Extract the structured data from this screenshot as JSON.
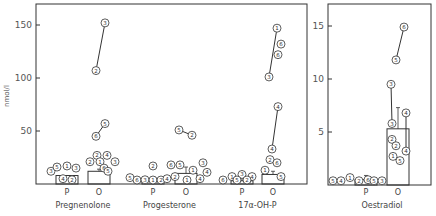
{
  "chart_data": [
    {
      "type": "bar",
      "panel": "left",
      "ylabel": "nmol/l",
      "ylim": [
        0,
        165
      ],
      "yticks": [
        50,
        100,
        150
      ],
      "grid": false,
      "groups": [
        {
          "name": "Pregnenolone",
          "conditions": [
            {
              "label": "P",
              "x": 67,
              "bar": 8,
              "points": [
                {
                  "id": "3",
                  "v": 12,
                  "x": 51
                },
                {
                  "id": "5",
                  "v": 16,
                  "x": 57
                },
                {
                  "id": "1",
                  "v": 17,
                  "x": 67
                },
                {
                  "id": "3",
                  "v": 15,
                  "x": 76
                },
                {
                  "id": "4",
                  "v": 5,
                  "x": 63
                },
                {
                  "id": "2",
                  "v": 4,
                  "x": 72
                }
              ]
            },
            {
              "label": "O",
              "x": 99,
              "bar": 12,
              "err": 14,
              "points": [
                {
                  "id": "2",
                  "v": 27,
                  "x": 97
                },
                {
                  "id": "4",
                  "v": 27,
                  "x": 107
                },
                {
                  "id": "2",
                  "v": 21,
                  "x": 90
                },
                {
                  "id": "1",
                  "v": 21,
                  "x": 100
                },
                {
                  "id": "3",
                  "v": 21,
                  "x": 115
                },
                {
                  "id": "6",
                  "v": 15,
                  "x": 104
                },
                {
                  "id": "5",
                  "v": 12,
                  "x": 108
                },
                {
                  "id": "6",
                  "v": 45,
                  "x": 96,
                  "link": 1
                },
                {
                  "id": "5",
                  "v": 57,
                  "x": 105,
                  "link": 1
                },
                {
                  "id": "2",
                  "v": 107,
                  "x": 96,
                  "link": 2
                },
                {
                  "id": "3",
                  "v": 152,
                  "x": 105,
                  "link": 2
                }
              ]
            }
          ]
        },
        {
          "name": "Progesterone",
          "conditions": [
            {
              "label": "P",
              "x": 153,
              "bar": 4,
              "err": 6,
              "points": [
                {
                  "id": "5",
                  "v": 6,
                  "x": 130
                },
                {
                  "id": "6",
                  "v": 3,
                  "x": 137
                },
                {
                  "id": "3",
                  "v": 4,
                  "x": 145
                },
                {
                  "id": "1",
                  "v": 3,
                  "x": 153
                },
                {
                  "id": "2",
                  "v": 3,
                  "x": 161
                },
                {
                  "id": "4",
                  "v": 5,
                  "x": 167
                },
                {
                  "id": "2",
                  "v": 17,
                  "x": 153
                }
              ]
            },
            {
              "label": "O",
              "x": 186,
              "bar": 10,
              "err": 16,
              "points": [
                {
                  "id": "6",
                  "v": 18,
                  "x": 171
                },
                {
                  "id": "5",
                  "v": 18,
                  "x": 180
                },
                {
                  "id": "3",
                  "v": 20,
                  "x": 203
                },
                {
                  "id": "1",
                  "v": 13,
                  "x": 193
                },
                {
                  "id": "4",
                  "v": 11,
                  "x": 207
                },
                {
                  "id": "4",
                  "v": 5,
                  "x": 200
                },
                {
                  "id": "1",
                  "v": 3,
                  "x": 187
                },
                {
                  "id": "2",
                  "v": 7,
                  "x": 175
                },
                {
                  "id": "5",
                  "v": 51,
                  "x": 179,
                  "link": 1
                },
                {
                  "id": "2",
                  "v": 46,
                  "x": 192,
                  "link": 1
                }
              ]
            }
          ]
        },
        {
          "name": "17α-OH-P",
          "conditions": [
            {
              "label": "P",
              "x": 242,
              "bar": 3,
              "err": 6,
              "points": [
                {
                  "id": "6",
                  "v": 3,
                  "x": 223
                },
                {
                  "id": "1",
                  "v": 7,
                  "x": 232
                },
                {
                  "id": "3",
                  "v": 9,
                  "x": 242
                },
                {
                  "id": "4",
                  "v": 7,
                  "x": 252
                },
                {
                  "id": "5",
                  "v": 2,
                  "x": 237
                },
                {
                  "id": "2",
                  "v": 2,
                  "x": 247
                }
              ]
            },
            {
              "label": "O",
              "x": 273,
              "bar": 9,
              "err": 12,
              "points": [
                {
                  "id": "1",
                  "v": 13,
                  "x": 265
                },
                {
                  "id": "2",
                  "v": 23,
                  "x": 270
                },
                {
                  "id": "6",
                  "v": 20,
                  "x": 277
                },
                {
                  "id": "5",
                  "v": 7,
                  "x": 281
                },
                {
                  "id": "4",
                  "v": 33,
                  "x": 272,
                  "link": 1
                },
                {
                  "id": "4",
                  "v": 73,
                  "x": 278,
                  "link": 1
                },
                {
                  "id": "3",
                  "v": 101,
                  "x": 269,
                  "link": 2
                },
                {
                  "id": "1",
                  "v": 147,
                  "x": 277,
                  "link": 2
                },
                {
                  "id": "6",
                  "v": 132,
                  "x": 281
                },
                {
                  "id": "6",
                  "v": 122,
                  "x": 278
                }
              ]
            }
          ]
        }
      ]
    },
    {
      "type": "bar",
      "panel": "right",
      "ylabel": "nmol/l",
      "ylim": [
        0,
        16.8
      ],
      "yticks": [
        5,
        10,
        15
      ],
      "grid": false,
      "groups": [
        {
          "name": "Oestradiol",
          "conditions": [
            {
              "label": "P",
              "x": 366,
              "bar": 0.5,
              "err": 0.9,
              "points": [
                {
                  "id": "5",
                  "v": 0.4,
                  "x": 333
                },
                {
                  "id": "4",
                  "v": 0.4,
                  "x": 341
                },
                {
                  "id": "1",
                  "v": 0.7,
                  "x": 350
                },
                {
                  "id": "2",
                  "v": 0.4,
                  "x": 359
                },
                {
                  "id": "6",
                  "v": 0.5,
                  "x": 368
                },
                {
                  "id": "5",
                  "v": 0.4,
                  "x": 374
                },
                {
                  "id": "3",
                  "v": 0.4,
                  "x": 382
                }
              ]
            },
            {
              "label": "O",
              "x": 398,
              "bar": 5.3,
              "err": 7.3,
              "points": [
                {
                  "id": "6",
                  "v": 14.9,
                  "x": 404,
                  "link": 1
                },
                {
                  "id": "5",
                  "v": 11.8,
                  "x": 396,
                  "link": 1
                },
                {
                  "id": "3",
                  "v": 9.5,
                  "x": 391,
                  "link": 2
                },
                {
                  "id": "3",
                  "v": 5.8,
                  "x": 392,
                  "link": 2
                },
                {
                  "id": "4",
                  "v": 6.8,
                  "x": 406,
                  "link": 3
                },
                {
                  "id": "4",
                  "v": 3.2,
                  "x": 406,
                  "link": 3
                },
                {
                  "id": "2",
                  "v": 4.3,
                  "x": 392
                },
                {
                  "id": "2",
                  "v": 3.7,
                  "x": 396
                },
                {
                  "id": "1",
                  "v": 2.7,
                  "x": 393
                },
                {
                  "id": "5",
                  "v": 2.3,
                  "x": 400
                }
              ]
            }
          ]
        }
      ]
    }
  ],
  "labels": {
    "ylabel": "nmol/l",
    "groups": [
      "Pregnenolone",
      "Progesterone",
      "17α-OH-P",
      "Oestradiol"
    ],
    "conditions": [
      "P",
      "O"
    ]
  },
  "colors": {
    "ink": "#333333",
    "background": "#ffffff"
  }
}
